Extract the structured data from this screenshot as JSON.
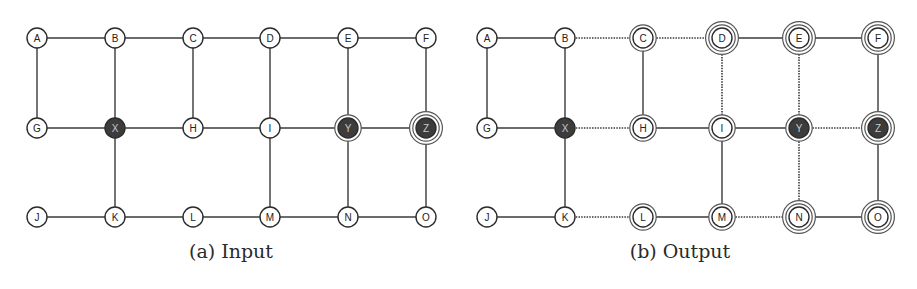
{
  "figures": [
    {
      "id": "input",
      "caption": "(a) Input",
      "x_offset": 0,
      "columns_x": [
        37,
        115,
        193,
        270,
        348,
        426
      ],
      "rows_y": [
        38,
        128,
        217
      ],
      "nodes": [
        {
          "id": "A",
          "col": 0,
          "row": 0,
          "fill": "white",
          "rings": 1
        },
        {
          "id": "B",
          "col": 1,
          "row": 0,
          "fill": "white",
          "rings": 1
        },
        {
          "id": "C",
          "col": 2,
          "row": 0,
          "fill": "white",
          "rings": 1
        },
        {
          "id": "D",
          "col": 3,
          "row": 0,
          "fill": "white",
          "rings": 1
        },
        {
          "id": "E",
          "col": 4,
          "row": 0,
          "fill": "white",
          "rings": 1
        },
        {
          "id": "F",
          "col": 5,
          "row": 0,
          "fill": "white",
          "rings": 1
        },
        {
          "id": "G",
          "col": 0,
          "row": 1,
          "fill": "white",
          "rings": 1
        },
        {
          "id": "X",
          "col": 1,
          "row": 1,
          "fill": "dark",
          "rings": 1
        },
        {
          "id": "H",
          "col": 2,
          "row": 1,
          "fill": "white",
          "rings": 1
        },
        {
          "id": "I",
          "col": 3,
          "row": 1,
          "fill": "white",
          "rings": 1
        },
        {
          "id": "Y",
          "col": 4,
          "row": 1,
          "fill": "dark",
          "rings": 2
        },
        {
          "id": "Z",
          "col": 5,
          "row": 1,
          "fill": "dark",
          "rings": 3
        },
        {
          "id": "J",
          "col": 0,
          "row": 2,
          "fill": "white",
          "rings": 1
        },
        {
          "id": "K",
          "col": 1,
          "row": 2,
          "fill": "white",
          "rings": 1
        },
        {
          "id": "L",
          "col": 2,
          "row": 2,
          "fill": "white",
          "rings": 1
        },
        {
          "id": "M",
          "col": 3,
          "row": 2,
          "fill": "white",
          "rings": 1
        },
        {
          "id": "N",
          "col": 4,
          "row": 2,
          "fill": "white",
          "rings": 1
        },
        {
          "id": "O",
          "col": 5,
          "row": 2,
          "fill": "white",
          "rings": 1
        }
      ],
      "edges": [
        {
          "from": "A",
          "to": "B",
          "style": "solid"
        },
        {
          "from": "B",
          "to": "C",
          "style": "solid"
        },
        {
          "from": "C",
          "to": "D",
          "style": "solid"
        },
        {
          "from": "D",
          "to": "E",
          "style": "solid"
        },
        {
          "from": "E",
          "to": "F",
          "style": "solid"
        },
        {
          "from": "G",
          "to": "X",
          "style": "solid"
        },
        {
          "from": "X",
          "to": "H",
          "style": "solid"
        },
        {
          "from": "H",
          "to": "I",
          "style": "solid"
        },
        {
          "from": "I",
          "to": "Y",
          "style": "solid"
        },
        {
          "from": "Y",
          "to": "Z",
          "style": "solid"
        },
        {
          "from": "J",
          "to": "K",
          "style": "solid"
        },
        {
          "from": "K",
          "to": "L",
          "style": "solid"
        },
        {
          "from": "L",
          "to": "M",
          "style": "solid"
        },
        {
          "from": "M",
          "to": "N",
          "style": "solid"
        },
        {
          "from": "N",
          "to": "O",
          "style": "solid"
        },
        {
          "from": "A",
          "to": "G",
          "style": "solid"
        },
        {
          "from": "B",
          "to": "X",
          "style": "solid"
        },
        {
          "from": "C",
          "to": "H",
          "style": "solid"
        },
        {
          "from": "D",
          "to": "I",
          "style": "solid"
        },
        {
          "from": "E",
          "to": "Y",
          "style": "solid"
        },
        {
          "from": "F",
          "to": "Z",
          "style": "solid"
        },
        {
          "from": "X",
          "to": "K",
          "style": "solid"
        },
        {
          "from": "I",
          "to": "M",
          "style": "solid"
        },
        {
          "from": "Y",
          "to": "N",
          "style": "solid"
        },
        {
          "from": "Z",
          "to": "O",
          "style": "solid"
        }
      ]
    },
    {
      "id": "output",
      "caption": "(b) Output",
      "x_offset": 0,
      "columns_x": [
        487,
        565,
        643,
        722,
        799,
        878
      ],
      "rows_y": [
        38,
        128,
        217
      ],
      "nodes": [
        {
          "id": "A",
          "col": 0,
          "row": 0,
          "fill": "white",
          "rings": 1
        },
        {
          "id": "B",
          "col": 1,
          "row": 0,
          "fill": "white",
          "rings": 1
        },
        {
          "id": "C",
          "col": 2,
          "row": 0,
          "fill": "white",
          "rings": 2
        },
        {
          "id": "D",
          "col": 3,
          "row": 0,
          "fill": "white",
          "rings": 3
        },
        {
          "id": "E",
          "col": 4,
          "row": 0,
          "fill": "white",
          "rings": 3
        },
        {
          "id": "F",
          "col": 5,
          "row": 0,
          "fill": "white",
          "rings": 3
        },
        {
          "id": "G",
          "col": 0,
          "row": 1,
          "fill": "white",
          "rings": 1
        },
        {
          "id": "X",
          "col": 1,
          "row": 1,
          "fill": "dark",
          "rings": 1
        },
        {
          "id": "H",
          "col": 2,
          "row": 1,
          "fill": "white",
          "rings": 2
        },
        {
          "id": "I",
          "col": 3,
          "row": 1,
          "fill": "white",
          "rings": 2
        },
        {
          "id": "Y",
          "col": 4,
          "row": 1,
          "fill": "dark",
          "rings": 2
        },
        {
          "id": "Z",
          "col": 5,
          "row": 1,
          "fill": "dark",
          "rings": 3
        },
        {
          "id": "J",
          "col": 0,
          "row": 2,
          "fill": "white",
          "rings": 1
        },
        {
          "id": "K",
          "col": 1,
          "row": 2,
          "fill": "white",
          "rings": 1
        },
        {
          "id": "L",
          "col": 2,
          "row": 2,
          "fill": "white",
          "rings": 2
        },
        {
          "id": "M",
          "col": 3,
          "row": 2,
          "fill": "white",
          "rings": 2
        },
        {
          "id": "N",
          "col": 4,
          "row": 2,
          "fill": "white",
          "rings": 3
        },
        {
          "id": "O",
          "col": 5,
          "row": 2,
          "fill": "white",
          "rings": 3
        }
      ],
      "edges": [
        {
          "from": "A",
          "to": "B",
          "style": "solid"
        },
        {
          "from": "B",
          "to": "C",
          "style": "dotted"
        },
        {
          "from": "C",
          "to": "D",
          "style": "dotted"
        },
        {
          "from": "D",
          "to": "E",
          "style": "solid"
        },
        {
          "from": "E",
          "to": "F",
          "style": "solid"
        },
        {
          "from": "G",
          "to": "X",
          "style": "solid"
        },
        {
          "from": "X",
          "to": "H",
          "style": "dotted"
        },
        {
          "from": "H",
          "to": "I",
          "style": "solid"
        },
        {
          "from": "I",
          "to": "Y",
          "style": "solid"
        },
        {
          "from": "Y",
          "to": "Z",
          "style": "dotted"
        },
        {
          "from": "J",
          "to": "K",
          "style": "solid"
        },
        {
          "from": "K",
          "to": "L",
          "style": "dotted"
        },
        {
          "from": "L",
          "to": "M",
          "style": "solid"
        },
        {
          "from": "M",
          "to": "N",
          "style": "dotted"
        },
        {
          "from": "N",
          "to": "O",
          "style": "solid"
        },
        {
          "from": "A",
          "to": "G",
          "style": "solid"
        },
        {
          "from": "B",
          "to": "X",
          "style": "solid"
        },
        {
          "from": "C",
          "to": "H",
          "style": "solid"
        },
        {
          "from": "D",
          "to": "I",
          "style": "dotted"
        },
        {
          "from": "E",
          "to": "Y",
          "style": "dotted"
        },
        {
          "from": "F",
          "to": "Z",
          "style": "solid"
        },
        {
          "from": "X",
          "to": "K",
          "style": "solid"
        },
        {
          "from": "I",
          "to": "M",
          "style": "solid"
        },
        {
          "from": "Y",
          "to": "N",
          "style": "dotted"
        },
        {
          "from": "Z",
          "to": "O",
          "style": "solid"
        }
      ]
    }
  ],
  "colors": {
    "stroke": "#2b2b2b",
    "edge": "#3a3a3a",
    "dark_fill": "#3c3c3c",
    "dark_text": "#c8c8c8",
    "white_fill": "#ffffff",
    "ring": "#555555"
  }
}
